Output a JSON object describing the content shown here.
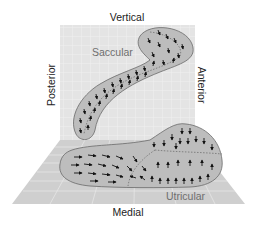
{
  "diagram": {
    "labels": {
      "top": "Vertical",
      "left": "Posterior",
      "right": "Anterior",
      "bottom": "Medial"
    },
    "regions": [
      {
        "name": "Saccular",
        "plane": "vertical"
      },
      {
        "name": "Utricular",
        "plane": "horizontal"
      }
    ],
    "colors": {
      "background": "#ffffff",
      "vertical_plane": "#e4e4e4",
      "floor_plane": "#cfcfcf",
      "grid_lines": "#f2f2f2",
      "macula_fill": "#bdbdbd",
      "macula_outline": "#6a6a6a",
      "arrows": "#111111",
      "striola": "#555555",
      "label_text": "#222222",
      "region_label_text": "#6e6e6e"
    }
  }
}
